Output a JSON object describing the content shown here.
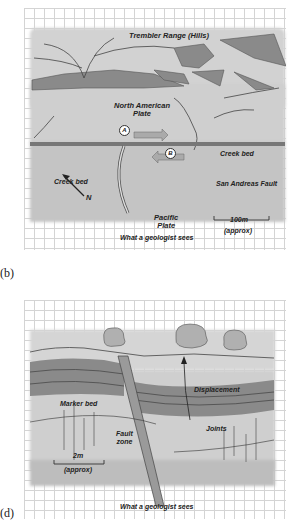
{
  "panel_b": {
    "label": "(b)",
    "caption": "What a geologist sees",
    "labels": {
      "hills": "Trembler Range (Hills)",
      "north_american_plate_line1": "North American",
      "north_american_plate_line2": "Plate",
      "creek_bed_upper": "Creek bed",
      "creek_bed_lower": "Creek bed",
      "fault": "San Andreas Fault",
      "pacific_plate_line1": "Pacific",
      "pacific_plate_line2": "Plate",
      "scale_value": "100m",
      "scale_note": "(approx)",
      "north": "N",
      "point_a": "A",
      "point_b": "B"
    }
  },
  "panel_d": {
    "label": "(d)",
    "caption": "What a geologist sees",
    "labels": {
      "displacement": "Displacement",
      "marker_bed": "Marker bed",
      "fault_zone_line1": "Fault",
      "fault_zone_line2": "zone",
      "joints": "Joints",
      "scale_value": "2m",
      "scale_note": "(approx)"
    }
  },
  "colors": {
    "grid": "#d4d4d4",
    "land_wash": "#c9c9c9",
    "hatch": "#7a7a7a",
    "ink": "#222222"
  }
}
